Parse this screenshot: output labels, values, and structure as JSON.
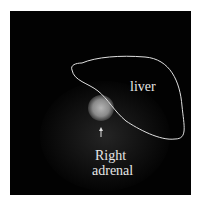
{
  "figure": {
    "labels": {
      "organ": "liver",
      "lesion_line1": "Right",
      "lesion_line2": "adrenal"
    },
    "colors": {
      "background": "#020202",
      "outline": "#e0e0e0",
      "hotspot": "#bdbdbd"
    }
  }
}
